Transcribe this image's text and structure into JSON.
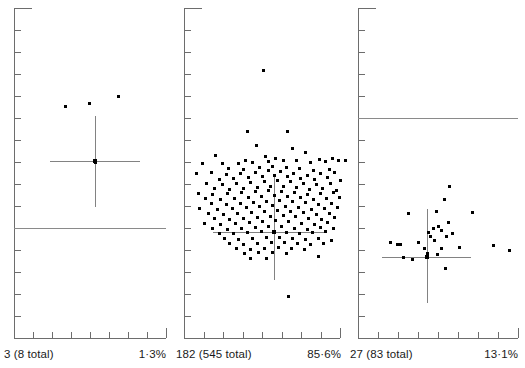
{
  "figure": {
    "type": "scatter-panels",
    "panel_count": 3,
    "dot_color": "#000000",
    "axis_color": "#6d6d6d",
    "crosshair_color": "#828282",
    "reference_line_color": "#8a8a8a",
    "background": "#ffffff"
  },
  "chart_data": {
    "type": "scatter",
    "title": "",
    "xlabel": "",
    "ylabel": "",
    "grid": false,
    "legend": null,
    "panels": [
      {
        "index": 1,
        "count_label": "3 (8 total)",
        "percent_label": "1·3%",
        "count": 3,
        "total": 8,
        "percent": 1.3,
        "has_reference_line": true,
        "reference_line_y": 228,
        "crosshair": {
          "cx": 95,
          "cy": 161,
          "v_top": 116,
          "v_bottom": 207,
          "h_left": 50,
          "h_right": 140
        },
        "points": [
          [
            65,
            106
          ],
          [
            89,
            103
          ],
          [
            118,
            96
          ],
          [
            95,
            162
          ]
        ]
      },
      {
        "index": 2,
        "count_label": "182 (545 total)",
        "percent_label": "85·6%",
        "count": 182,
        "total": 545,
        "percent": 85.6,
        "has_reference_line": false,
        "reference_line_y": null,
        "crosshair": {
          "cx": 274,
          "cy": 232,
          "v_top": 176,
          "v_bottom": 280,
          "h_left": 213,
          "h_right": 325
        },
        "points": [
          [
            263,
            70
          ],
          [
            247,
            131
          ],
          [
            287,
            131
          ],
          [
            256,
            145
          ],
          [
            292,
            148
          ],
          [
            305,
            152
          ],
          [
            215,
            155
          ],
          [
            265,
            156
          ],
          [
            275,
            158
          ],
          [
            245,
            160
          ],
          [
            319,
            159
          ],
          [
            332,
            158
          ],
          [
            202,
            163
          ],
          [
            222,
            163
          ],
          [
            238,
            163
          ],
          [
            252,
            162
          ],
          [
            268,
            161
          ],
          [
            283,
            160
          ],
          [
            296,
            160
          ],
          [
            310,
            162
          ],
          [
            325,
            161
          ],
          [
            338,
            160
          ],
          [
            345,
            160
          ],
          [
            228,
            168
          ],
          [
            243,
            169
          ],
          [
            259,
            167
          ],
          [
            272,
            166
          ],
          [
            286,
            167
          ],
          [
            299,
            168
          ],
          [
            313,
            170
          ],
          [
            329,
            169
          ],
          [
            196,
            173
          ],
          [
            211,
            172
          ],
          [
            226,
            174
          ],
          [
            240,
            173
          ],
          [
            255,
            172
          ],
          [
            268,
            170
          ],
          [
            280,
            171
          ],
          [
            293,
            173
          ],
          [
            307,
            175
          ],
          [
            320,
            173
          ],
          [
            334,
            172
          ],
          [
            219,
            179
          ],
          [
            233,
            178
          ],
          [
            248,
            177
          ],
          [
            262,
            176
          ],
          [
            274,
            175
          ],
          [
            287,
            176
          ],
          [
            300,
            178
          ],
          [
            314,
            179
          ],
          [
            327,
            177
          ],
          [
            340,
            180
          ],
          [
            206,
            183
          ],
          [
            222,
            184
          ],
          [
            236,
            183
          ],
          [
            250,
            182
          ],
          [
            264,
            181
          ],
          [
            277,
            180
          ],
          [
            290,
            181
          ],
          [
            303,
            183
          ],
          [
            316,
            184
          ],
          [
            330,
            183
          ],
          [
            214,
            188
          ],
          [
            229,
            189
          ],
          [
            243,
            188
          ],
          [
            257,
            187
          ],
          [
            270,
            186
          ],
          [
            283,
            186
          ],
          [
            296,
            187
          ],
          [
            309,
            189
          ],
          [
            322,
            188
          ],
          [
            336,
            190
          ],
          [
            198,
            193
          ],
          [
            212,
            194
          ],
          [
            227,
            193
          ],
          [
            241,
            192
          ],
          [
            255,
            191
          ],
          [
            268,
            190
          ],
          [
            281,
            191
          ],
          [
            294,
            192
          ],
          [
            307,
            194
          ],
          [
            320,
            193
          ],
          [
            333,
            192
          ],
          [
            205,
            198
          ],
          [
            220,
            199
          ],
          [
            234,
            198
          ],
          [
            248,
            197
          ],
          [
            261,
            196
          ],
          [
            274,
            195
          ],
          [
            287,
            196
          ],
          [
            300,
            197
          ],
          [
            313,
            199
          ],
          [
            326,
            198
          ],
          [
            339,
            197
          ],
          [
            211,
            203
          ],
          [
            226,
            204
          ],
          [
            240,
            203
          ],
          [
            253,
            202
          ],
          [
            266,
            201
          ],
          [
            279,
            200
          ],
          [
            292,
            201
          ],
          [
            305,
            202
          ],
          [
            318,
            204
          ],
          [
            331,
            203
          ],
          [
            199,
            208
          ],
          [
            217,
            209
          ],
          [
            232,
            208
          ],
          [
            246,
            207
          ],
          [
            259,
            206
          ],
          [
            272,
            205
          ],
          [
            285,
            206
          ],
          [
            298,
            207
          ],
          [
            311,
            209
          ],
          [
            324,
            208
          ],
          [
            337,
            207
          ],
          [
            208,
            213
          ],
          [
            223,
            214
          ],
          [
            237,
            213
          ],
          [
            251,
            212
          ],
          [
            264,
            211
          ],
          [
            277,
            210
          ],
          [
            290,
            211
          ],
          [
            303,
            212
          ],
          [
            316,
            214
          ],
          [
            329,
            213
          ],
          [
            214,
            218
          ],
          [
            229,
            219
          ],
          [
            243,
            218
          ],
          [
            257,
            217
          ],
          [
            270,
            216
          ],
          [
            283,
            215
          ],
          [
            295,
            216
          ],
          [
            308,
            218
          ],
          [
            321,
            219
          ],
          [
            334,
            217
          ],
          [
            204,
            223
          ],
          [
            220,
            224
          ],
          [
            235,
            223
          ],
          [
            249,
            222
          ],
          [
            262,
            221
          ],
          [
            275,
            220
          ],
          [
            288,
            221
          ],
          [
            301,
            223
          ],
          [
            314,
            224
          ],
          [
            327,
            222
          ],
          [
            212,
            228
          ],
          [
            227,
            229
          ],
          [
            241,
            228
          ],
          [
            255,
            227
          ],
          [
            268,
            226
          ],
          [
            281,
            226
          ],
          [
            294,
            228
          ],
          [
            307,
            229
          ],
          [
            320,
            227
          ],
          [
            333,
            228
          ],
          [
            219,
            233
          ],
          [
            233,
            233
          ],
          [
            247,
            232
          ],
          [
            261,
            231
          ],
          [
            274,
            231
          ],
          [
            286,
            232
          ],
          [
            299,
            233
          ],
          [
            312,
            232
          ],
          [
            325,
            231
          ],
          [
            224,
            238
          ],
          [
            238,
            239
          ],
          [
            252,
            238
          ],
          [
            266,
            237
          ],
          [
            279,
            237
          ],
          [
            292,
            238
          ],
          [
            305,
            239
          ],
          [
            318,
            238
          ],
          [
            331,
            240
          ],
          [
            229,
            243
          ],
          [
            243,
            244
          ],
          [
            257,
            243
          ],
          [
            271,
            242
          ],
          [
            284,
            242
          ],
          [
            297,
            243
          ],
          [
            310,
            244
          ],
          [
            323,
            243
          ],
          [
            236,
            248
          ],
          [
            250,
            249
          ],
          [
            264,
            248
          ],
          [
            278,
            247
          ],
          [
            291,
            248
          ],
          [
            304,
            249
          ],
          [
            244,
            253
          ],
          [
            258,
            252
          ],
          [
            272,
            252
          ],
          [
            286,
            253
          ],
          [
            250,
            258
          ],
          [
            266,
            258
          ],
          [
            318,
            256
          ],
          [
            288,
            296
          ]
        ]
      },
      {
        "index": 3,
        "count_label": "27 (83 total)",
        "percent_label": "13·1%",
        "count": 27,
        "total": 83,
        "percent": 13.1,
        "has_reference_line": true,
        "reference_line_y": 118,
        "crosshair": {
          "cx": 427,
          "cy": 257,
          "v_top": 209,
          "v_bottom": 303,
          "h_left": 382,
          "h_right": 471
        },
        "points": [
          [
            449,
            186
          ],
          [
            444,
            199
          ],
          [
            436,
            211
          ],
          [
            472,
            212
          ],
          [
            408,
            213
          ],
          [
            448,
            222
          ],
          [
            438,
            226
          ],
          [
            433,
            228
          ],
          [
            441,
            230
          ],
          [
            428,
            232
          ],
          [
            430,
            236
          ],
          [
            452,
            233
          ],
          [
            446,
            236
          ],
          [
            434,
            240
          ],
          [
            390,
            242
          ],
          [
            397,
            244
          ],
          [
            400,
            244
          ],
          [
            418,
            242
          ],
          [
            424,
            248
          ],
          [
            441,
            248
          ],
          [
            459,
            247
          ],
          [
            493,
            245
          ],
          [
            509,
            250
          ],
          [
            427,
            253
          ],
          [
            437,
            254
          ],
          [
            412,
            259
          ],
          [
            403,
            257
          ],
          [
            445,
            268
          ]
        ]
      }
    ]
  },
  "panel1": {
    "count_label": "3 (8 total)",
    "percent_label": "1·3%"
  },
  "panel2": {
    "count_label": "182 (545 total)",
    "percent_label": "85·6%"
  },
  "panel3": {
    "count_label": "27 (83 total)",
    "percent_label": "13·1%"
  }
}
